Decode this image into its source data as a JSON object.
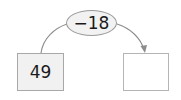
{
  "diagram": {
    "operation": {
      "label": "−18"
    },
    "start_box": {
      "value": "49"
    },
    "result_box": {
      "value": ""
    },
    "colors": {
      "stroke": "#8c8c8c",
      "box_fill_start": "#f1f1f1",
      "box_fill_result": "#ffffff",
      "ellipse_fill": "#f2f2f2",
      "text": "#1a1a1a"
    }
  }
}
